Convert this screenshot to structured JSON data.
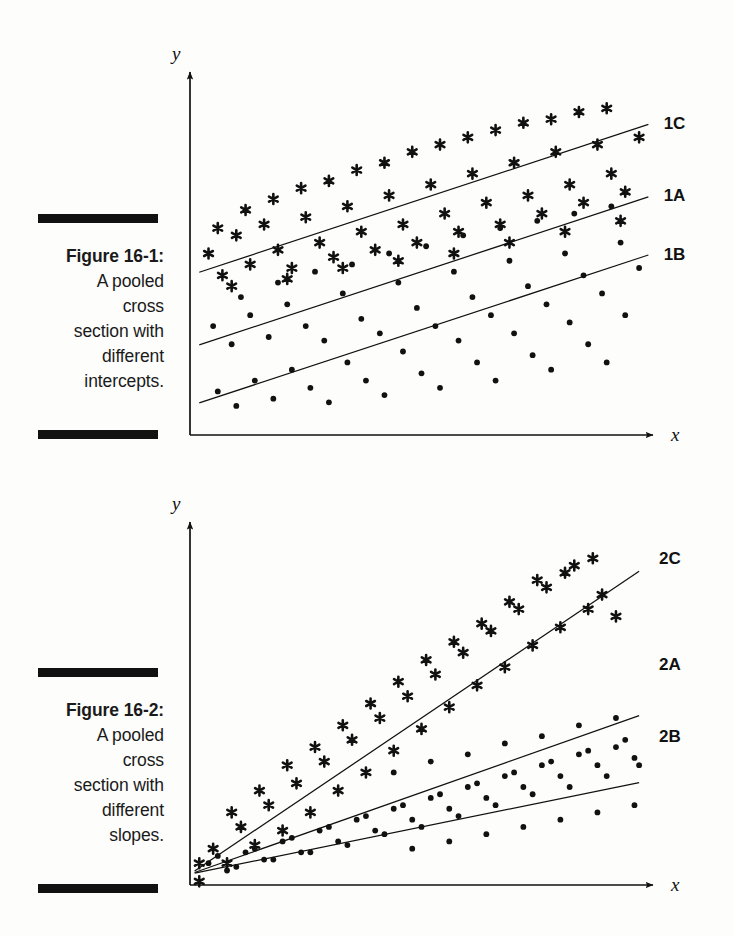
{
  "page": {
    "background": "#fdfdfc",
    "ink": "#111111",
    "width": 733,
    "height": 936
  },
  "figures": [
    {
      "id": "figure-1",
      "caption": {
        "title": "Figure 16-1:",
        "lines": [
          "A pooled",
          "cross",
          "section with",
          "different",
          "intercepts."
        ]
      },
      "axes": {
        "x_label": "x",
        "y_label": "y"
      },
      "chart_data": {
        "type": "scatter",
        "title": "A pooled cross section with different intercepts",
        "xlabel": "x",
        "ylabel": "y",
        "grid": false,
        "legend": "inline-right-of-lines",
        "xlim": [
          0,
          100
        ],
        "ylim": [
          0,
          100
        ],
        "note": "Three parallel fitted lines with equal slope and different intercepts; star markers scatter about the top line (1C), dot markers scatter about the lower two lines (1A, 1B).",
        "series": [
          {
            "name": "1C",
            "marker": "star",
            "line": {
              "slope": 0.42,
              "intercept": 44,
              "x_from": 2,
              "x_to": 99
            },
            "label_position": {
              "x": 101,
              "y": 86
            },
            "points": [
              [
                4,
                50
              ],
              [
                7,
                44
              ],
              [
                10,
                55
              ],
              [
                13,
                47
              ],
              [
                16,
                58
              ],
              [
                19,
                51
              ],
              [
                22,
                46
              ],
              [
                25,
                60
              ],
              [
                28,
                53
              ],
              [
                31,
                49
              ],
              [
                34,
                63
              ],
              [
                37,
                56
              ],
              [
                40,
                51
              ],
              [
                43,
                66
              ],
              [
                46,
                58
              ],
              [
                49,
                53
              ],
              [
                52,
                69
              ],
              [
                55,
                61
              ],
              [
                58,
                56
              ],
              [
                61,
                72
              ],
              [
                64,
                64
              ],
              [
                67,
                58
              ],
              [
                70,
                75
              ],
              [
                73,
                66
              ],
              [
                76,
                61
              ],
              [
                79,
                78
              ],
              [
                82,
                69
              ],
              [
                85,
                64
              ],
              [
                88,
                80
              ],
              [
                91,
                72
              ],
              [
                94,
                67
              ],
              [
                97,
                82
              ],
              [
                6,
                57
              ],
              [
                12,
                62
              ],
              [
                18,
                65
              ],
              [
                24,
                68
              ],
              [
                30,
                70
              ],
              [
                36,
                73
              ],
              [
                42,
                75
              ],
              [
                48,
                78
              ],
              [
                54,
                80
              ],
              [
                60,
                82
              ],
              [
                66,
                84
              ],
              [
                72,
                86
              ],
              [
                78,
                87
              ],
              [
                84,
                89
              ],
              [
                90,
                90
              ],
              [
                9,
                41
              ],
              [
                21,
                43
              ],
              [
                33,
                46
              ],
              [
                45,
                48
              ],
              [
                57,
                50
              ],
              [
                69,
                53
              ],
              [
                81,
                56
              ],
              [
                93,
                59
              ]
            ]
          },
          {
            "name": "1A",
            "marker": "dot",
            "line": {
              "slope": 0.42,
              "intercept": 24,
              "x_from": 2,
              "x_to": 99
            },
            "label_position": {
              "x": 101,
              "y": 66
            },
            "points": [
              [
                5,
                30
              ],
              [
                9,
                25
              ],
              [
                13,
                33
              ],
              [
                17,
                27
              ],
              [
                21,
                36
              ],
              [
                25,
                30
              ],
              [
                29,
                26
              ],
              [
                33,
                39
              ],
              [
                37,
                32
              ],
              [
                41,
                28
              ],
              [
                45,
                42
              ],
              [
                49,
                35
              ],
              [
                53,
                30
              ],
              [
                57,
                45
              ],
              [
                61,
                38
              ],
              [
                65,
                33
              ],
              [
                69,
                48
              ],
              [
                73,
                41
              ],
              [
                77,
                36
              ],
              [
                81,
                50
              ],
              [
                85,
                44
              ],
              [
                89,
                39
              ],
              [
                93,
                53
              ],
              [
                97,
                46
              ],
              [
                11,
                38
              ],
              [
                19,
                42
              ],
              [
                27,
                45
              ],
              [
                35,
                47
              ],
              [
                43,
                50
              ],
              [
                51,
                52
              ],
              [
                59,
                55
              ],
              [
                67,
                57
              ],
              [
                75,
                59
              ],
              [
                83,
                61
              ],
              [
                91,
                63
              ]
            ]
          },
          {
            "name": "1B",
            "marker": "dot",
            "line": {
              "slope": 0.42,
              "intercept": 8,
              "x_from": 2,
              "x_to": 99
            },
            "label_position": {
              "x": 101,
              "y": 50
            },
            "points": [
              [
                6,
                12
              ],
              [
                10,
                8
              ],
              [
                14,
                15
              ],
              [
                18,
                10
              ],
              [
                22,
                18
              ],
              [
                26,
                13
              ],
              [
                30,
                9
              ],
              [
                34,
                20
              ],
              [
                38,
                15
              ],
              [
                42,
                11
              ],
              [
                46,
                23
              ],
              [
                50,
                17
              ],
              [
                54,
                13
              ],
              [
                58,
                26
              ],
              [
                62,
                20
              ],
              [
                66,
                15
              ],
              [
                70,
                28
              ],
              [
                74,
                22
              ],
              [
                78,
                18
              ],
              [
                82,
                31
              ],
              [
                86,
                25
              ],
              [
                90,
                20
              ],
              [
                94,
                33
              ]
            ]
          }
        ]
      }
    },
    {
      "id": "figure-2",
      "caption": {
        "title": "Figure 16-2:",
        "lines": [
          "A pooled",
          "cross",
          "section with",
          "different",
          "slopes."
        ]
      },
      "axes": {
        "x_label": "x",
        "y_label": "y"
      },
      "chart_data": {
        "type": "scatter",
        "title": "A pooled cross section with different slopes",
        "xlabel": "x",
        "ylabel": "y",
        "grid": false,
        "legend": "inline-right-of-lines",
        "xlim": [
          0,
          100
        ],
        "ylim": [
          0,
          100
        ],
        "note": "Three fitted lines sharing a common intercept at the origin region but with different slopes; star markers scatter about the steepest line (2C), dot markers about the two shallower lines (2A, 2B).",
        "series": [
          {
            "name": "2C",
            "marker": "star",
            "line": {
              "slope": 0.86,
              "intercept": 3,
              "x_from": 1,
              "x_to": 97
            },
            "label_position": {
              "x": 100,
              "y": 90
            },
            "points": [
              [
                2,
                6
              ],
              [
                2,
                1
              ],
              [
                5,
                10
              ],
              [
                8,
                6
              ],
              [
                11,
                16
              ],
              [
                14,
                11
              ],
              [
                17,
                22
              ],
              [
                20,
                15
              ],
              [
                23,
                28
              ],
              [
                26,
                20
              ],
              [
                29,
                34
              ],
              [
                32,
                26
              ],
              [
                35,
                40
              ],
              [
                38,
                31
              ],
              [
                41,
                46
              ],
              [
                44,
                37
              ],
              [
                47,
                52
              ],
              [
                50,
                43
              ],
              [
                53,
                58
              ],
              [
                56,
                49
              ],
              [
                59,
                64
              ],
              [
                62,
                55
              ],
              [
                65,
                70
              ],
              [
                68,
                60
              ],
              [
                71,
                76
              ],
              [
                74,
                66
              ],
              [
                77,
                82
              ],
              [
                80,
                71
              ],
              [
                83,
                88
              ],
              [
                86,
                76
              ],
              [
                89,
                80
              ],
              [
                92,
                74
              ],
              [
                9,
                20
              ],
              [
                15,
                26
              ],
              [
                21,
                33
              ],
              [
                27,
                38
              ],
              [
                33,
                44
              ],
              [
                39,
                50
              ],
              [
                45,
                56
              ],
              [
                51,
                62
              ],
              [
                57,
                67
              ],
              [
                63,
                72
              ],
              [
                69,
                78
              ],
              [
                75,
                84
              ],
              [
                81,
                86
              ],
              [
                87,
                90
              ]
            ]
          },
          {
            "name": "2A",
            "marker": "dot",
            "line": {
              "slope": 0.45,
              "intercept": 3,
              "x_from": 1,
              "x_to": 97
            },
            "label_position": {
              "x": 100,
              "y": 61
            },
            "points": [
              [
                4,
                6
              ],
              [
                8,
                4
              ],
              [
                12,
                9
              ],
              [
                16,
                7
              ],
              [
                20,
                12
              ],
              [
                24,
                9
              ],
              [
                28,
                15
              ],
              [
                32,
                12
              ],
              [
                36,
                18
              ],
              [
                40,
                15
              ],
              [
                44,
                21
              ],
              [
                48,
                18
              ],
              [
                52,
                24
              ],
              [
                56,
                21
              ],
              [
                60,
                27
              ],
              [
                64,
                24
              ],
              [
                68,
                30
              ],
              [
                72,
                27
              ],
              [
                76,
                33
              ],
              [
                80,
                30
              ],
              [
                84,
                36
              ],
              [
                88,
                33
              ],
              [
                92,
                38
              ],
              [
                96,
                35
              ]
            ]
          },
          {
            "name": "2B",
            "marker": "dot",
            "line": {
              "slope": 0.26,
              "intercept": 3,
              "x_from": 1,
              "x_to": 97
            },
            "label_position": {
              "x": 100,
              "y": 41
            },
            "points": [
              [
                6,
                8
              ],
              [
                10,
                5
              ],
              [
                14,
                10
              ],
              [
                18,
                7
              ],
              [
                22,
                13
              ],
              [
                26,
                9
              ],
              [
                30,
                16
              ],
              [
                34,
                11
              ],
              [
                38,
                19
              ],
              [
                42,
                14
              ],
              [
                46,
                22
              ],
              [
                50,
                16
              ],
              [
                54,
                25
              ],
              [
                58,
                19
              ],
              [
                62,
                28
              ],
              [
                66,
                22
              ],
              [
                70,
                31
              ],
              [
                74,
                25
              ],
              [
                78,
                34
              ],
              [
                82,
                27
              ],
              [
                86,
                37
              ],
              [
                90,
                30
              ],
              [
                94,
                40
              ],
              [
                97,
                33
              ],
              [
                44,
                31
              ],
              [
                52,
                34
              ],
              [
                60,
                36
              ],
              [
                68,
                39
              ],
              [
                76,
                41
              ],
              [
                84,
                44
              ],
              [
                92,
                46
              ],
              [
                48,
                10
              ],
              [
                56,
                12
              ],
              [
                64,
                14
              ],
              [
                72,
                16
              ],
              [
                80,
                18
              ],
              [
                88,
                20
              ],
              [
                96,
                22
              ]
            ]
          }
        ]
      }
    }
  ]
}
